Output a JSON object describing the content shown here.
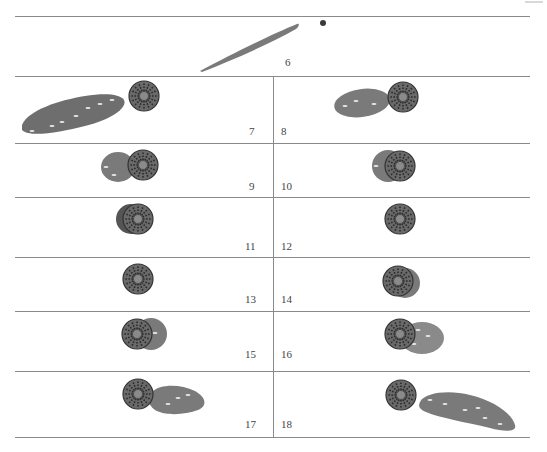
{
  "figure": {
    "panels": [
      {
        "id": "panel-6",
        "label": "6"
      },
      {
        "id": "panel-7",
        "label": "7"
      },
      {
        "id": "panel-8",
        "label": "8"
      },
      {
        "id": "panel-9",
        "label": "9"
      },
      {
        "id": "panel-10",
        "label": "10"
      },
      {
        "id": "panel-11",
        "label": "11"
      },
      {
        "id": "panel-12",
        "label": "12"
      },
      {
        "id": "panel-13",
        "label": "13"
      },
      {
        "id": "panel-14",
        "label": "14"
      },
      {
        "id": "panel-15",
        "label": "15"
      },
      {
        "id": "panel-16",
        "label": "16"
      },
      {
        "id": "panel-17",
        "label": "17"
      },
      {
        "id": "panel-18",
        "label": "18"
      }
    ],
    "colors": {
      "rule": "#8a8a8a",
      "disc_dark": "#3a3a3a",
      "disc_mid": "#6e6e6e",
      "blob": "#7d7d7d",
      "label": "#444444"
    }
  }
}
